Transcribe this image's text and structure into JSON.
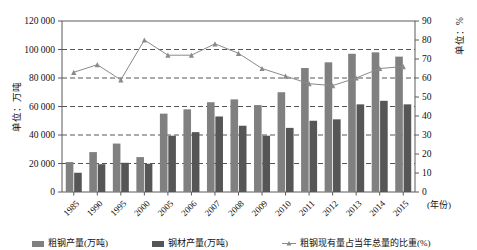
{
  "chart_data": {
    "type": "bar",
    "title": "",
    "categories": [
      "1985",
      "1990",
      "1995",
      "2000",
      "2005",
      "2006",
      "2007",
      "2008",
      "2009",
      "2010",
      "2011",
      "2012",
      "2013",
      "2014",
      "2015"
    ],
    "xlabel": "(年份)",
    "left_axis": {
      "label": "单位：万吨",
      "ticks": [
        "0",
        "20 000",
        "40 000",
        "60 000",
        "80 000",
        "100 000",
        "120 000"
      ],
      "ylim": [
        0,
        120000
      ]
    },
    "right_axis": {
      "label": "单位：%",
      "ticks": [
        "0",
        "10",
        "20",
        "30",
        "40",
        "50",
        "60",
        "70",
        "80",
        "90"
      ],
      "ylim": [
        0,
        90
      ]
    },
    "series": [
      {
        "name": "粗钢产量(万吨)",
        "type": "bar",
        "axis": "left",
        "color": "#808080",
        "values": [
          21000,
          28000,
          34000,
          24500,
          55000,
          58000,
          63000,
          65000,
          61000,
          70000,
          87000,
          91000,
          97000,
          98000,
          95000
        ]
      },
      {
        "name": "钢材产量(万吨)",
        "type": "bar",
        "axis": "left",
        "color": "#565656",
        "values": [
          13500,
          19500,
          20500,
          19800,
          39500,
          42000,
          53000,
          46500,
          39500,
          45000,
          50000,
          51000,
          61500,
          64000,
          61500
        ]
      },
      {
        "name": "粗钢现有量占当年总量的比重(%)",
        "type": "line",
        "axis": "right",
        "color": "#8a8a8a",
        "values": [
          63,
          67,
          59,
          80,
          72,
          72,
          78,
          73,
          65,
          61,
          57,
          56,
          60,
          65,
          66
        ]
      }
    ],
    "legend": {
      "position": "bottom",
      "entries": [
        "粗钢产量(万吨)",
        "钢材产量(万吨)",
        "粗钢现有量占当年总量的比重(%)"
      ]
    },
    "grid": true
  }
}
